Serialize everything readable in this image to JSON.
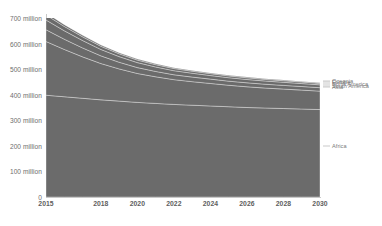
{
  "title_fragment": "Population",
  "chart_data": {
    "type": "area",
    "stacked": true,
    "title": "",
    "xlabel": "",
    "ylabel": "",
    "xlim": [
      2015,
      2030
    ],
    "ylim": [
      0,
      700000000
    ],
    "grid": false,
    "fill_color": "#6b6b6b",
    "axis_color": "#c9c9c9",
    "background": "#ffffff",
    "legend_position": "right-edge-inline",
    "x": [
      2015,
      2016,
      2017,
      2018,
      2019,
      2020,
      2021,
      2022,
      2023,
      2024,
      2025,
      2026,
      2027,
      2028,
      2029,
      2030
    ],
    "xticks": [
      "2015",
      "2018",
      "2020",
      "2022",
      "2024",
      "2026",
      "2028",
      "2030"
    ],
    "xtick_values": [
      2015,
      2018,
      2020,
      2022,
      2024,
      2026,
      2028,
      2030
    ],
    "yticks": [
      "0",
      "100 million",
      "200 million",
      "300 million",
      "400 million",
      "500 million",
      "600 million",
      "700 million"
    ],
    "ytick_values": [
      0,
      100000000,
      200000000,
      300000000,
      400000000,
      500000000,
      600000000,
      700000000
    ],
    "series": [
      {
        "name": "Africa",
        "label_value": 200000000,
        "values": [
          398000000,
          392000000,
          386000000,
          380000000,
          375000000,
          370000000,
          366000000,
          362000000,
          359000000,
          356000000,
          353000000,
          350000000,
          348000000,
          346000000,
          344000000,
          342000000
        ]
      },
      {
        "name": "Asia",
        "label_value": 430000000,
        "values": [
          210000000,
          185000000,
          162000000,
          142000000,
          126000000,
          113000000,
          104000000,
          97000000,
          92000000,
          88000000,
          84000000,
          81000000,
          78000000,
          76000000,
          74000000,
          72000000
        ]
      },
      {
        "name": "South America",
        "label_value": 436000000,
        "values": [
          46000000,
          40000000,
          35000000,
          30000000,
          26000000,
          23000000,
          21000000,
          19000000,
          18000000,
          17000000,
          16000000,
          15500000,
          15000000,
          14500000,
          14000000,
          13500000
        ]
      },
      {
        "name": "North America",
        "label_value": 442000000,
        "values": [
          38000000,
          33000000,
          29000000,
          25000000,
          22000000,
          19500000,
          17500000,
          16000000,
          15000000,
          14000000,
          13500000,
          13000000,
          12500000,
          12000000,
          11500000,
          11000000
        ]
      },
      {
        "name": "Europe",
        "label_value": 448000000,
        "values": [
          20000000,
          17000000,
          14500000,
          12500000,
          11000000,
          9800000,
          9000000,
          8300000,
          7800000,
          7400000,
          7000000,
          6700000,
          6400000,
          6200000,
          6000000,
          5800000
        ]
      },
      {
        "name": "Oceania",
        "label_value": 454000000,
        "values": [
          8000000,
          6800000,
          5800000,
          5000000,
          4400000,
          3900000,
          3600000,
          3300000,
          3100000,
          2900000,
          2800000,
          2700000,
          2600000,
          2500000,
          2400000,
          2300000
        ]
      }
    ],
    "totals": [
      720000000,
      673800000,
      632300000,
      594500000,
      564400000,
      539200000,
      521100000,
      505600000,
      494900000,
      485300000,
      476300000,
      468900000,
      462500000,
      457200000,
      451900000,
      446600000
    ]
  }
}
